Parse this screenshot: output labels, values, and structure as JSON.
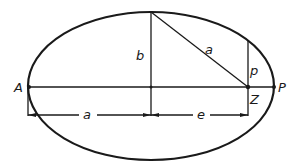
{
  "diagram": {
    "colors": {
      "ink": "#1a1a1a",
      "background": "#ffffff"
    },
    "labels": {
      "aphelion": "A",
      "perihelion": "P",
      "focus": "Z",
      "semi_minor": "b",
      "hypotenuse": "a",
      "semi_latus_rectum": "p",
      "dim_semi_major": "a",
      "dim_eccentricity": "e"
    }
  }
}
